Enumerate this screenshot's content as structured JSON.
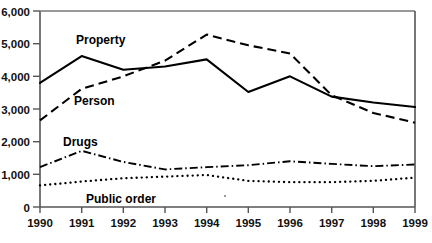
{
  "chart_data": {
    "type": "line",
    "title": "",
    "xlabel": "",
    "ylabel": "",
    "x": [
      1990,
      1991,
      1992,
      1993,
      1994,
      1995,
      1996,
      1997,
      1998,
      1999
    ],
    "categories": [
      "1990",
      "1991",
      "1992",
      "1993",
      "1994",
      "1995",
      "1996",
      "1997",
      "1998",
      "1999"
    ],
    "series": [
      {
        "name": "Property",
        "style": "solid",
        "values": [
          3800,
          4620,
          4200,
          4300,
          4520,
          3520,
          4000,
          3380,
          3200,
          3060
        ]
      },
      {
        "name": "Person",
        "style": "dashed",
        "values": [
          2650,
          3620,
          4000,
          4480,
          5280,
          4950,
          4700,
          3420,
          2880,
          2580
        ]
      },
      {
        "name": "Drugs",
        "style": "dash-dot",
        "values": [
          1220,
          1720,
          1380,
          1150,
          1220,
          1280,
          1400,
          1320,
          1250,
          1300
        ]
      },
      {
        "name": "Public order",
        "style": "dotted",
        "values": [
          660,
          780,
          880,
          930,
          980,
          800,
          760,
          760,
          800,
          900
        ]
      }
    ],
    "yticks": [
      0,
      1000,
      2000,
      3000,
      4000,
      5000,
      6000
    ],
    "ytick_labels": [
      "0",
      "1,000",
      "2,000",
      "3,000",
      "4,000",
      "5,000",
      "6,000"
    ],
    "ylim": [
      0,
      6000
    ],
    "xlim": [
      1990,
      1999
    ],
    "grid": false,
    "legend": "inline-labels",
    "annotations": [
      {
        "text": "Property",
        "x": 1991.5,
        "y": 5050
      },
      {
        "text": "Person",
        "x": 1991.2,
        "y": 3180
      },
      {
        "text": "Drugs",
        "x": 1991.0,
        "y": 2080
      },
      {
        "text": "Public order",
        "x": 1991.6,
        "y": 420
      }
    ],
    "colors": {
      "line": "#000000",
      "axis": "#555555",
      "text": "#111111",
      "background": "#ffffff"
    }
  },
  "axes": {
    "y_axis_name": "y-axis",
    "x_axis_name": "x-axis"
  },
  "footer": {
    "smudge_text": "· · - · · - · · - · - · - · · - · - · · - · · - · - · ·"
  }
}
